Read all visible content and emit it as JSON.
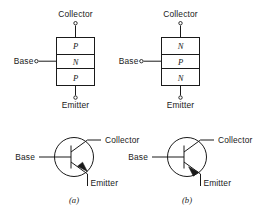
{
  "figure": {
    "ink_color": "#1a1a1a",
    "background_color": "#ffffff"
  },
  "terminals": {
    "collector": "Collector",
    "base": "Base",
    "emitter": "Emitter"
  },
  "panels": [
    {
      "id": "a",
      "caption": "(a)",
      "device_type": "pnp",
      "block_diagram": {
        "layers": [
          {
            "position": "top",
            "label": "P",
            "terminal": "Collector"
          },
          {
            "position": "middle",
            "label": "N",
            "terminal": "Base"
          },
          {
            "position": "bottom",
            "label": "P",
            "terminal": "Emitter"
          }
        ],
        "collector_label": "Collector",
        "base_label": "Base",
        "emitter_label": "Emitter"
      },
      "symbol": {
        "collector_label": "Collector",
        "base_label": "Base",
        "emitter_label": "Emitter",
        "emitter_arrow_direction": "in"
      }
    },
    {
      "id": "b",
      "caption": "(b)",
      "device_type": "npn",
      "block_diagram": {
        "layers": [
          {
            "position": "top",
            "label": "N",
            "terminal": "Collector"
          },
          {
            "position": "middle",
            "label": "P",
            "terminal": "Base"
          },
          {
            "position": "bottom",
            "label": "N",
            "terminal": "Emitter"
          }
        ],
        "collector_label": "Collector",
        "base_label": "Base",
        "emitter_label": "Emitter"
      },
      "symbol": {
        "collector_label": "Collector",
        "base_label": "Base",
        "emitter_label": "Emitter",
        "emitter_arrow_direction": "out"
      }
    }
  ]
}
